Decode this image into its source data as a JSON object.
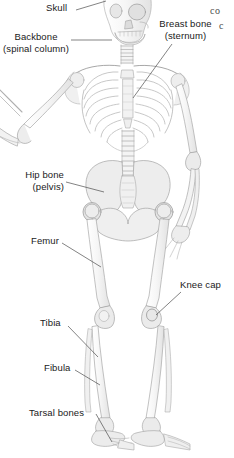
{
  "figure": {
    "type": "anatomical-diagram",
    "background_color": "#ffffff",
    "label_color": "#1a1a1a",
    "leader_line_color": "#4d4d4d",
    "bone_outline_color": "#9a9a9a",
    "bone_fill_color": "#f2f2f2"
  },
  "labels": [
    {
      "id": "skull",
      "name": "Skull",
      "line1": "Skull",
      "line2": "",
      "x": 46,
      "y": 2,
      "align": "left"
    },
    {
      "id": "backbone",
      "name": "Backbone (spinal column)",
      "line1": "Backbone",
      "line2": "(spinal column)",
      "x": 2,
      "y": 31,
      "align": "center"
    },
    {
      "id": "breast-bone",
      "name": "Breast bone (sternum)",
      "line1": "Breast bone",
      "line2": "(sternum)",
      "x": 159,
      "y": 18,
      "align": "center"
    },
    {
      "id": "hip-bone",
      "name": "Hip bone (pelvis)",
      "line1": "Hip bone",
      "line2": "(pelvis)",
      "x": 22,
      "y": 169,
      "align": "right"
    },
    {
      "id": "femur",
      "name": "Femur",
      "line1": "Femur",
      "line2": "",
      "x": 31,
      "y": 235,
      "align": "left"
    },
    {
      "id": "knee-cap",
      "name": "Knee cap",
      "line1": "Knee cap",
      "line2": "",
      "x": 180,
      "y": 279,
      "align": "left"
    },
    {
      "id": "tibia",
      "name": "Tibia",
      "line1": "Tibia",
      "line2": "",
      "x": 40,
      "y": 317,
      "align": "left"
    },
    {
      "id": "fibula",
      "name": "Fibula",
      "line1": "Fibula",
      "line2": "",
      "x": 44,
      "y": 362,
      "align": "left"
    },
    {
      "id": "tarsal-bones",
      "name": "Tarsal bones",
      "line1": "Tarsal bones",
      "line2": "",
      "x": 29,
      "y": 407,
      "align": "left"
    }
  ],
  "corner_text": [
    {
      "id": "corner-co",
      "text": "co",
      "x": 210,
      "y": 5
    },
    {
      "id": "corner-c",
      "text": "c",
      "x": 219,
      "y": 20
    }
  ]
}
